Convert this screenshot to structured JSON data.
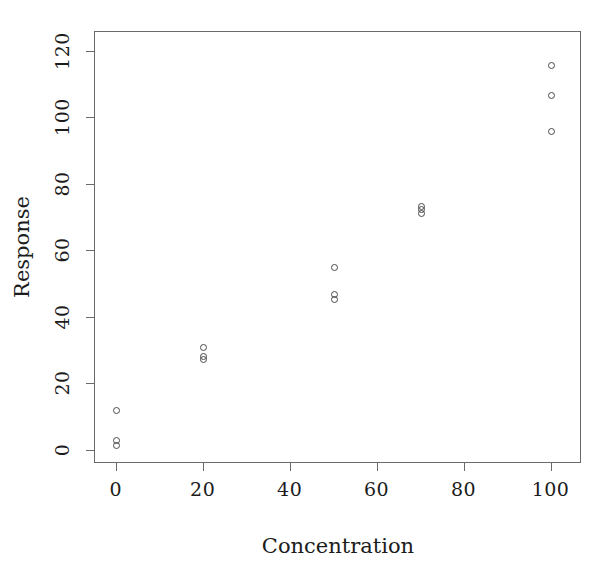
{
  "chart_data": {
    "type": "scatter",
    "title": "",
    "xlabel": "Concentration",
    "ylabel": "Response",
    "xlim": [
      -5,
      107
    ],
    "ylim": [
      -4,
      126
    ],
    "xticks": [
      0,
      20,
      40,
      60,
      80,
      100
    ],
    "yticks": [
      0,
      20,
      40,
      60,
      80,
      100,
      120
    ],
    "xtick_labels": [
      "0",
      "20",
      "40",
      "60",
      "80",
      "100"
    ],
    "ytick_labels": [
      "0",
      "20",
      "40",
      "60",
      "80",
      "100",
      "120"
    ],
    "grid": false,
    "legend": null,
    "marker": "open-circle",
    "marker_color": "#4a4a4a",
    "points": [
      {
        "x": 0,
        "y": 12
      },
      {
        "x": 0,
        "y": 3
      },
      {
        "x": 0,
        "y": 1.5
      },
      {
        "x": 20,
        "y": 31
      },
      {
        "x": 20,
        "y": 28.5
      },
      {
        "x": 20,
        "y": 27.5
      },
      {
        "x": 50,
        "y": 55
      },
      {
        "x": 50,
        "y": 47
      },
      {
        "x": 50,
        "y": 45.5
      },
      {
        "x": 70,
        "y": 73.5
      },
      {
        "x": 70,
        "y": 72.5
      },
      {
        "x": 70,
        "y": 71.5
      },
      {
        "x": 100,
        "y": 116
      },
      {
        "x": 100,
        "y": 107
      },
      {
        "x": 100,
        "y": 96
      }
    ]
  },
  "figure": {
    "background": "#ffffff",
    "axis_color": "#6a6a6a",
    "text_color": "#1c1c1c"
  }
}
